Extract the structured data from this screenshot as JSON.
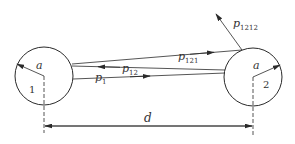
{
  "diagram": {
    "type": "two-sphere multiple reflection ray diagram",
    "bodies": [
      {
        "id": "1",
        "label": "1",
        "radius_label": "a"
      },
      {
        "id": "2",
        "label": "2",
        "radius_label": "a"
      }
    ],
    "rays": [
      {
        "id": "p1",
        "label_main": "p",
        "label_sub": "1",
        "from": "1",
        "to": "2"
      },
      {
        "id": "p12",
        "label_main": "p",
        "label_sub": "12",
        "from": "2",
        "to": "1"
      },
      {
        "id": "p121",
        "label_main": "p",
        "label_sub": "121",
        "from": "1",
        "to": "2"
      },
      {
        "id": "p1212",
        "label_main": "p",
        "label_sub": "1212",
        "from": "2",
        "to": "outward"
      }
    ],
    "distance_label": "d",
    "colors": {
      "line": "#2a2a2a",
      "background": "#ffffff"
    }
  }
}
